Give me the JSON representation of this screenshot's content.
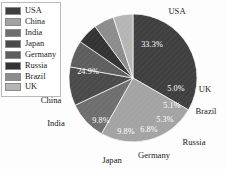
{
  "chart_data": {
    "type": "pie",
    "title": "",
    "xlabel": "",
    "ylabel": "",
    "categories": [
      "USA",
      "China",
      "India",
      "Japan",
      "Germany",
      "Russia",
      "Brazil",
      "UK"
    ],
    "values": [
      33.3,
      24.9,
      9.8,
      9.8,
      6.8,
      5.3,
      5.1,
      5.0
    ],
    "value_labels": [
      "33.3%",
      "24.9%",
      "9.8%",
      "9.8%",
      "6.8%",
      "5.3%",
      "5.1%",
      "5.0%"
    ],
    "colors": [
      "#3f3f3f",
      "#a3a3a3",
      "#6e6e6e",
      "#4a4a4a",
      "#5e5e5e",
      "#333333",
      "#8c8c8c",
      "#b5b5b5"
    ],
    "legend_position": "top-left",
    "grid": false,
    "start_angle_deg": -90,
    "direction": "clockwise",
    "label_style": "external-category-internal-percent"
  },
  "legend": {
    "items": [
      {
        "label": "USA",
        "color": "#3f3f3f"
      },
      {
        "label": "China",
        "color": "#a3a3a3"
      },
      {
        "label": "India",
        "color": "#6e6e6e"
      },
      {
        "label": "Japan",
        "color": "#4a4a4a"
      },
      {
        "label": "Germany",
        "color": "#5e5e5e"
      },
      {
        "label": "Russia",
        "color": "#333333"
      },
      {
        "label": "Brazil",
        "color": "#8c8c8c"
      },
      {
        "label": "UK",
        "color": "#b5b5b5"
      }
    ]
  },
  "pie_geometry": {
    "cx": 133,
    "cy": 78,
    "r": 64
  },
  "slice_percent_labels": [
    {
      "text": "33.3%",
      "x": 152,
      "y": 45
    },
    {
      "text": "24.9%",
      "x": 88,
      "y": 72
    },
    {
      "text": "9.8%",
      "x": 101,
      "y": 121
    },
    {
      "text": "9.8%",
      "x": 126,
      "y": 132
    },
    {
      "text": "6.8%",
      "x": 149,
      "y": 130
    },
    {
      "text": "5.3%",
      "x": 165,
      "y": 120
    },
    {
      "text": "5.1%",
      "x": 172,
      "y": 106
    },
    {
      "text": "5.0%",
      "x": 176,
      "y": 89
    }
  ],
  "category_labels": [
    {
      "text": "USA",
      "x": 177,
      "y": 12,
      "anchor": "middle"
    },
    {
      "text": "UK",
      "x": 205,
      "y": 90,
      "anchor": "middle"
    },
    {
      "text": "Brazil",
      "x": 206,
      "y": 112,
      "anchor": "middle"
    },
    {
      "text": "Russia",
      "x": 194,
      "y": 143,
      "anchor": "middle"
    },
    {
      "text": "Germany",
      "x": 154,
      "y": 156,
      "anchor": "middle"
    },
    {
      "text": "Japan",
      "x": 112,
      "y": 161,
      "anchor": "middle"
    },
    {
      "text": "India",
      "x": 56,
      "y": 124,
      "anchor": "middle"
    },
    {
      "text": "China",
      "x": 51,
      "y": 101,
      "anchor": "middle"
    }
  ]
}
